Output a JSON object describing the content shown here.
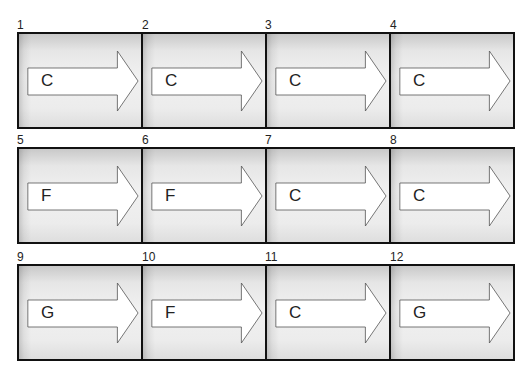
{
  "diagram": {
    "type": "chord-progression-grid",
    "rows": 3,
    "columns": 4,
    "cells": [
      {
        "number": "1",
        "chord": "C"
      },
      {
        "number": "2",
        "chord": "C"
      },
      {
        "number": "3",
        "chord": "C"
      },
      {
        "number": "4",
        "chord": "C"
      },
      {
        "number": "5",
        "chord": "F"
      },
      {
        "number": "6",
        "chord": "F"
      },
      {
        "number": "7",
        "chord": "C"
      },
      {
        "number": "8",
        "chord": "C"
      },
      {
        "number": "9",
        "chord": "G"
      },
      {
        "number": "10",
        "chord": "F"
      },
      {
        "number": "11",
        "chord": "C"
      },
      {
        "number": "12",
        "chord": "G"
      }
    ],
    "icon": "right-arrow-icon",
    "colors": {
      "border": "#111111",
      "arrow_fill": "#ffffff",
      "arrow_stroke": "#555555",
      "cell_background": "#ececec"
    }
  }
}
